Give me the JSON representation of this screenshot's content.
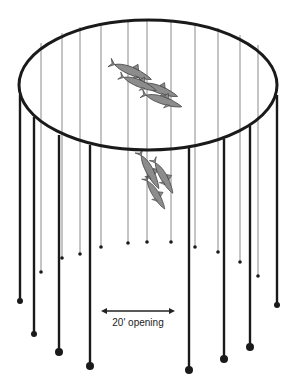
{
  "diagram": {
    "type": "purse-seine-net-illustration",
    "colors": {
      "ring": "#1a1a1a",
      "thick_pole": "#1a1a1a",
      "thin_pole": "#8a8a8a",
      "fish": "#8c8c8c",
      "fish_outline": "#3a3a3a",
      "background": "#ffffff"
    },
    "ring": {
      "cx": 148,
      "cy": 85,
      "rx": 129,
      "ry": 65
    },
    "back_lines": [
      {
        "x": 41,
        "top": 43,
        "end": 272
      },
      {
        "x": 62,
        "top": 33,
        "end": 258
      },
      {
        "x": 80,
        "top": 27,
        "end": 254
      },
      {
        "x": 101,
        "top": 23,
        "end": 247
      },
      {
        "x": 128,
        "top": 20,
        "end": 243
      },
      {
        "x": 147,
        "top": 20,
        "end": 242
      },
      {
        "x": 171,
        "top": 21,
        "end": 242
      },
      {
        "x": 195,
        "top": 23,
        "end": 247
      },
      {
        "x": 218,
        "top": 28,
        "end": 252
      },
      {
        "x": 240,
        "top": 35,
        "end": 262
      },
      {
        "x": 258,
        "top": 45,
        "end": 276
      }
    ],
    "front_poles": [
      {
        "x": 20,
        "top": 95,
        "end": 301,
        "r": 3
      },
      {
        "x": 34,
        "top": 117,
        "end": 334,
        "r": 3
      },
      {
        "x": 59,
        "top": 135,
        "end": 352,
        "r": 4
      },
      {
        "x": 90,
        "top": 145,
        "end": 366,
        "r": 4
      },
      {
        "x": 189,
        "top": 148,
        "end": 370,
        "r": 4
      },
      {
        "x": 224,
        "top": 139,
        "end": 359,
        "r": 4
      },
      {
        "x": 250,
        "top": 126,
        "end": 347,
        "r": 4
      },
      {
        "x": 277,
        "top": 95,
        "end": 305,
        "r": 3
      }
    ],
    "fish_groups": [
      {
        "name": "fish-school-top",
        "x": 112,
        "y": 62,
        "count": 4
      },
      {
        "name": "fish-school-middle",
        "x": 140,
        "y": 158,
        "count": 3
      }
    ],
    "opening_arrow": {
      "x1": 101,
      "x2": 175,
      "y": 311,
      "label": "20' opening",
      "label_x": 138,
      "label_y": 326
    }
  }
}
